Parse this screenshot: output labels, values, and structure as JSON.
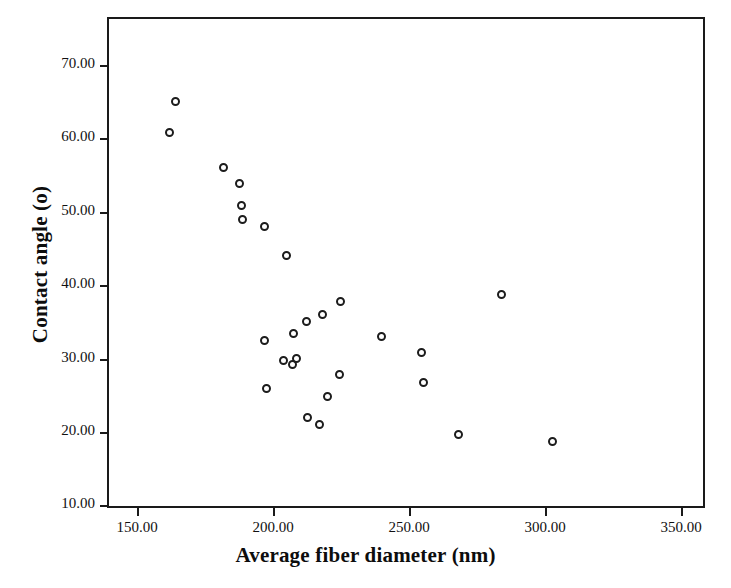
{
  "chart_data": {
    "type": "scatter",
    "title": "",
    "xlabel": "Average fiber diameter (nm)",
    "ylabel": "Contact angle (o)",
    "xlim": [
      130,
      350
    ],
    "ylim": [
      10,
      75
    ],
    "xticks": [
      "150.00",
      "200.00",
      "250.00",
      "300.00",
      "350.00"
    ],
    "xtick_values": [
      150,
      200,
      250,
      300,
      350
    ],
    "yticks": [
      "10.00",
      "20.00",
      "30.00",
      "40.00",
      "50.00",
      "60.00",
      "70.00"
    ],
    "ytick_values": [
      10,
      20,
      30,
      40,
      50,
      60,
      70
    ],
    "grid": false,
    "legend": null,
    "marker": "open-circle",
    "marker_color": "#1c1c1c",
    "points": [
      {
        "x": 164.3,
        "y": 65.0
      },
      {
        "x": 161.8,
        "y": 60.8
      },
      {
        "x": 181.6,
        "y": 56.0
      },
      {
        "x": 187.5,
        "y": 53.8
      },
      {
        "x": 188.4,
        "y": 50.9
      },
      {
        "x": 188.6,
        "y": 48.9
      },
      {
        "x": 196.7,
        "y": 48.0
      },
      {
        "x": 204.8,
        "y": 44.0
      },
      {
        "x": 224.8,
        "y": 37.8
      },
      {
        "x": 218.1,
        "y": 36.0
      },
      {
        "x": 212.4,
        "y": 35.0
      },
      {
        "x": 207.5,
        "y": 33.4
      },
      {
        "x": 196.8,
        "y": 32.5
      },
      {
        "x": 239.7,
        "y": 33.0
      },
      {
        "x": 254.7,
        "y": 30.8
      },
      {
        "x": 284.1,
        "y": 38.7
      },
      {
        "x": 204.0,
        "y": 29.8
      },
      {
        "x": 207.0,
        "y": 29.2
      },
      {
        "x": 208.5,
        "y": 30.0
      },
      {
        "x": 224.5,
        "y": 27.8
      },
      {
        "x": 255.4,
        "y": 26.8
      },
      {
        "x": 197.5,
        "y": 26.0
      },
      {
        "x": 220.0,
        "y": 24.8
      },
      {
        "x": 212.8,
        "y": 22.0
      },
      {
        "x": 217.2,
        "y": 21.0
      },
      {
        "x": 268.2,
        "y": 19.7
      },
      {
        "x": 302.9,
        "y": 18.7
      }
    ]
  }
}
